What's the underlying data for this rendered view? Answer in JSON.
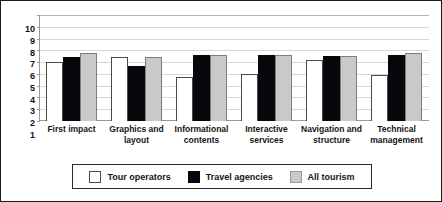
{
  "chart_data": {
    "type": "bar",
    "title": "",
    "xlabel": "",
    "ylabel": "",
    "ylim": [
      1,
      10
    ],
    "yticks": [
      1,
      2,
      3,
      4,
      5,
      6,
      7,
      8,
      9,
      10
    ],
    "grid": true,
    "legend_position": "bottom",
    "categories": [
      "First impact",
      "Graphics and layout",
      "Informational contents",
      "Interactive services",
      "Navigation and structure",
      "Technical management"
    ],
    "series": [
      {
        "name": "Tour operators",
        "color": "#ffffff",
        "values": [
          6.0,
          6.4,
          4.7,
          5.0,
          6.2,
          4.9
        ]
      },
      {
        "name": "Travel agencies",
        "color": "#08080c",
        "values": [
          6.4,
          5.7,
          6.6,
          6.6,
          6.5,
          6.6
        ]
      },
      {
        "name": "All tourism",
        "color": "#c9c9c9",
        "values": [
          6.8,
          6.4,
          6.6,
          6.6,
          6.5,
          6.8
        ]
      }
    ]
  }
}
